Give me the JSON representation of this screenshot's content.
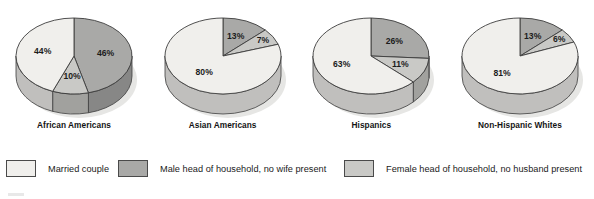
{
  "chart_data": {
    "type": "pie",
    "title": "",
    "subtitle": "",
    "xlabel": "",
    "ylabel": "",
    "grid": false,
    "legend_position": "bottom",
    "value_suffix": "%",
    "categories": [
      "Married couple",
      "Male head of household, no wife present",
      "Female head of household, no husband present"
    ],
    "category_colors": [
      "#f0efec",
      "#a9a9a7",
      "#c9c9c6"
    ],
    "charts": [
      {
        "title": "African Americans",
        "labels": [
          "44%",
          "46%",
          "10%"
        ],
        "values": [
          44,
          46,
          10
        ],
        "slice_categories": [
          "Married couple",
          "Male head of household, no wife present",
          "Female head of household, no husband present"
        ]
      },
      {
        "title": "Asian Americans",
        "labels": [
          "80%",
          "13%",
          "7%"
        ],
        "values": [
          80,
          13,
          7
        ],
        "slice_categories": [
          "Married couple",
          "Male head of household, no wife present",
          "Female head of household, no husband present"
        ]
      },
      {
        "title": "Hispanics",
        "labels": [
          "63%",
          "26%",
          "11%"
        ],
        "values": [
          63,
          26,
          11
        ],
        "slice_categories": [
          "Married couple",
          "Male head of household, no wife present",
          "Female head of household, no husband present"
        ]
      },
      {
        "title": "Non-Hispanic Whites",
        "labels": [
          "81%",
          "13%",
          "6%"
        ],
        "values": [
          81,
          13,
          6
        ],
        "slice_categories": [
          "Married couple",
          "Male head of household, no wife present",
          "Female head of household, no husband present"
        ]
      }
    ]
  },
  "legend": {
    "items": [
      {
        "label": "Married couple",
        "color": "#f0efec"
      },
      {
        "label": "Male head of household, no wife present",
        "color": "#a9a9a7"
      },
      {
        "label": "Female head of household, no husband present",
        "color": "#c9c9c6"
      }
    ]
  },
  "pies": [
    {
      "title": "African Americans"
    },
    {
      "title": "Asian Americans"
    },
    {
      "title": "Hispanics"
    },
    {
      "title": "Non-Hispanic Whites"
    }
  ]
}
